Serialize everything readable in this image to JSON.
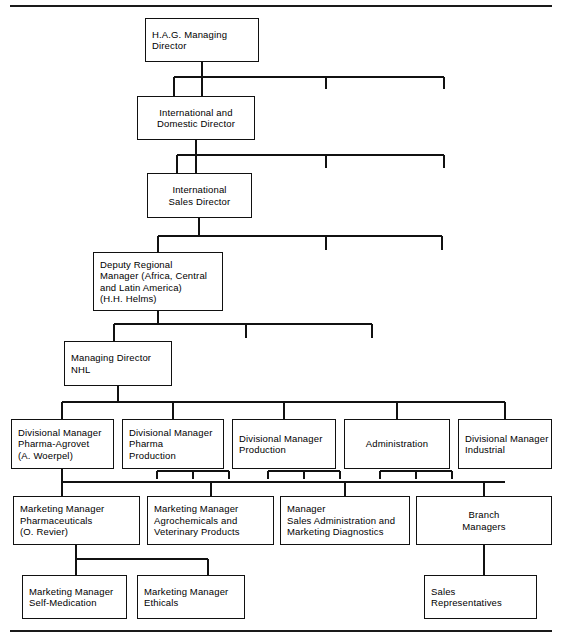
{
  "document": {
    "type": "organizational-chart",
    "title": "",
    "top_rule": true,
    "bottom_rule": true
  },
  "nodes": [
    {
      "id": "hag-managing-director",
      "lines": [
        "H.A.G. Managing",
        "Director"
      ],
      "x": 145,
      "y": 18,
      "w": 114,
      "h": 44,
      "align": "left",
      "level": 1
    },
    {
      "id": "international-and-domestic-director",
      "lines": [
        "International and",
        "Domestic Director"
      ],
      "x": 137,
      "y": 96,
      "w": 118,
      "h": 44,
      "align": "center",
      "level": 2
    },
    {
      "id": "international-sales-director",
      "lines": [
        "International",
        "Sales Director"
      ],
      "x": 147,
      "y": 173,
      "w": 105,
      "h": 45,
      "align": "center",
      "level": 3
    },
    {
      "id": "deputy-regional-manager",
      "lines": [
        "Deputy Regional",
        "Manager (Africa, Central",
        "and Latin America)",
        "(H.H. Helms)"
      ],
      "x": 93,
      "y": 252,
      "w": 130,
      "h": 59,
      "align": "left",
      "level": 4
    },
    {
      "id": "managing-director-nhl",
      "lines": [
        "Managing Director",
        "NHL"
      ],
      "x": 64,
      "y": 341,
      "w": 108,
      "h": 45,
      "align": "left",
      "level": 5
    },
    {
      "id": "divisional-manager-pharma-agrovet",
      "lines": [
        "Divisional Manager",
        "Pharma-Agrovet",
        "(A. Woerpel)"
      ],
      "x": 11,
      "y": 419,
      "w": 103,
      "h": 50,
      "align": "left",
      "level": 6
    },
    {
      "id": "divisional-manager-pharma-production",
      "lines": [
        "Divisional Manager",
        "Pharma",
        "Production"
      ],
      "x": 122,
      "y": 419,
      "w": 102,
      "h": 50,
      "align": "left",
      "level": 6
    },
    {
      "id": "divisional-manager-production",
      "lines": [
        "Divisional Manager",
        "Production"
      ],
      "x": 232,
      "y": 419,
      "w": 104,
      "h": 50,
      "align": "left",
      "level": 6
    },
    {
      "id": "administration",
      "lines": [
        "Administration"
      ],
      "x": 344,
      "y": 419,
      "w": 106,
      "h": 50,
      "align": "center",
      "level": 6
    },
    {
      "id": "divisional-manager-industrial",
      "lines": [
        "Divisional Manager",
        "Industrial"
      ],
      "x": 458,
      "y": 419,
      "w": 94,
      "h": 50,
      "align": "left",
      "level": 6
    },
    {
      "id": "marketing-manager-pharmaceuticals",
      "lines": [
        "Marketing Manager",
        "Pharmaceuticals",
        "(O. Revier)"
      ],
      "x": 13,
      "y": 496,
      "w": 127,
      "h": 49,
      "align": "left",
      "level": 7
    },
    {
      "id": "marketing-manager-agrochemicals",
      "lines": [
        "Marketing Manager",
        "Agrochemicals and",
        "Veterinary Products"
      ],
      "x": 147,
      "y": 496,
      "w": 127,
      "h": 49,
      "align": "left",
      "level": 7
    },
    {
      "id": "manager-sales-administration",
      "lines": [
        "Manager",
        "Sales Administration and",
        "Marketing Diagnostics"
      ],
      "x": 280,
      "y": 496,
      "w": 130,
      "h": 49,
      "align": "left",
      "level": 7
    },
    {
      "id": "branch-managers",
      "lines": [
        "Branch",
        "Managers"
      ],
      "x": 416,
      "y": 496,
      "w": 136,
      "h": 49,
      "align": "center",
      "level": 7
    },
    {
      "id": "marketing-manager-self-medication",
      "lines": [
        "Marketing Manager",
        "Self-Medication"
      ],
      "x": 22,
      "y": 575,
      "w": 105,
      "h": 44,
      "align": "left",
      "level": 8
    },
    {
      "id": "marketing-manager-ethicals",
      "lines": [
        "Marketing Manager",
        "Ethicals"
      ],
      "x": 137,
      "y": 575,
      "w": 108,
      "h": 44,
      "align": "left",
      "level": 8
    },
    {
      "id": "sales-representatives",
      "lines": [
        "Sales",
        "Representatives"
      ],
      "x": 424,
      "y": 575,
      "w": 113,
      "h": 44,
      "align": "left",
      "level": 8
    }
  ],
  "style": {
    "line_color": "#111111",
    "box_fill": "#ffffff",
    "page_background": "#ffffff"
  }
}
